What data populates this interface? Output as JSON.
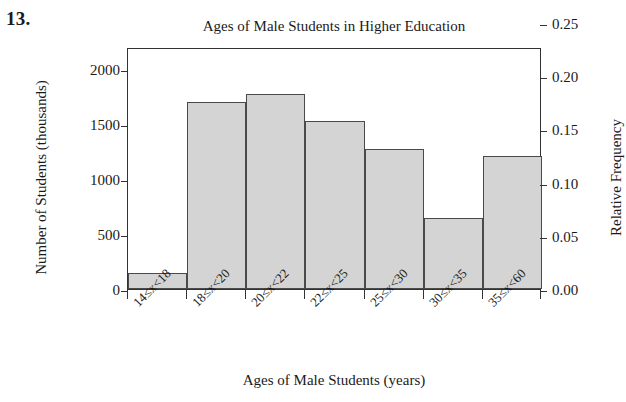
{
  "problem_number": "13.",
  "chart_data": {
    "type": "bar",
    "title": "Ages of Male Students in Higher Education",
    "xlabel": "Ages of Male Students (years)",
    "ylabel": "Number of Students (thousands)",
    "ylabel_right": "Relative Frequency",
    "categories": [
      "14≤x<18",
      "18≤x<20",
      "20≤x<22",
      "22≤x<25",
      "25≤x<30",
      "30≤x<35",
      "35≤x<60"
    ],
    "values": [
      150,
      1700,
      1775,
      1525,
      1270,
      650,
      1210
    ],
    "relative_frequency": [
      0.015,
      0.172,
      0.18,
      0.154,
      0.128,
      0.066,
      0.122
    ],
    "ylim": [
      0,
      2200
    ],
    "ylim_right": [
      0.0,
      0.2273
    ],
    "yticks": [
      0,
      500,
      1000,
      1500,
      2000
    ],
    "ytick_labels": [
      "0",
      "500",
      "1000",
      "1500",
      "2000"
    ],
    "yticks_right": [
      0.0,
      0.05,
      0.1,
      0.15,
      0.2,
      0.25
    ],
    "ytick_labels_right": [
      "0.00",
      "0.05",
      "0.10",
      "0.15",
      "0.20",
      "0.25"
    ],
    "grid": false,
    "legend": false,
    "bar_fill_color": "#d4d4d4",
    "bar_edge_color": "#4a4a4a",
    "axis_color": "#333333"
  }
}
